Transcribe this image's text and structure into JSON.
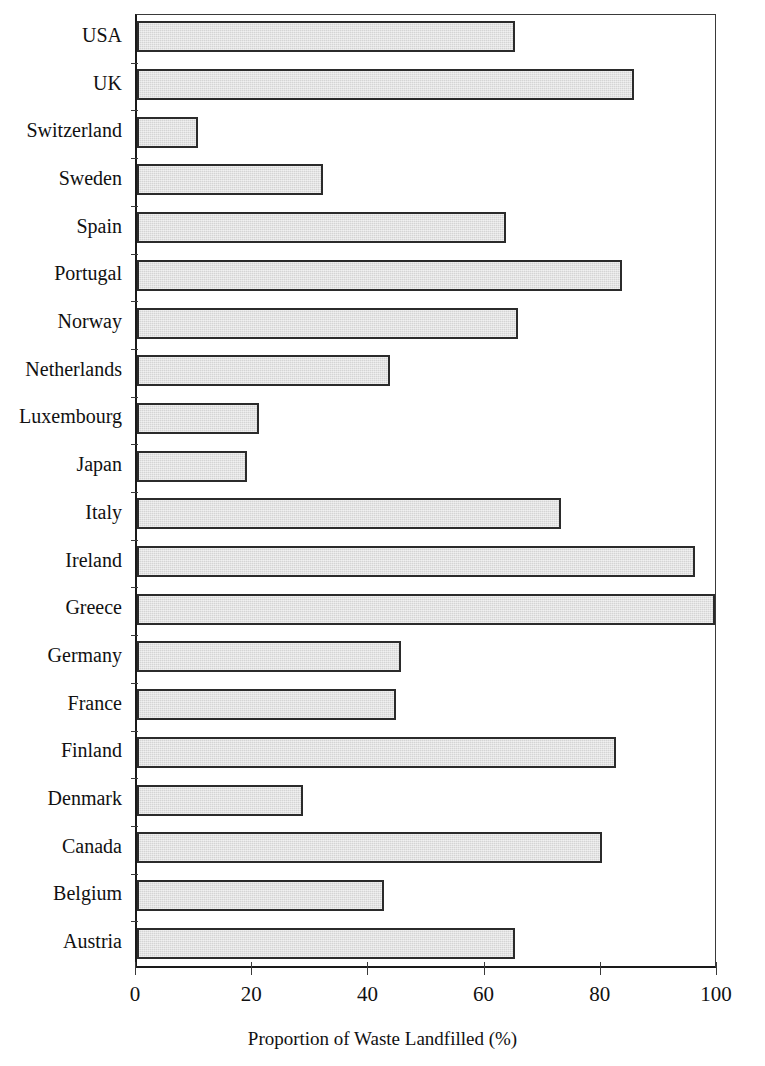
{
  "chart_data": {
    "type": "bar",
    "orientation": "horizontal",
    "title": "",
    "xlabel": "Proportion of Waste Landfilled (%)",
    "ylabel": "",
    "xlim": [
      0,
      100
    ],
    "xticks": [
      0,
      20,
      40,
      60,
      80,
      100
    ],
    "xtick_labels": [
      "0",
      "20",
      "40",
      "60",
      "80",
      "100"
    ],
    "grid": false,
    "legend": false,
    "categories": [
      "USA",
      "UK",
      "Switzerland",
      "Sweden",
      "Spain",
      "Portugal",
      "Norway",
      "Netherlands",
      "Luxembourg",
      "Japan",
      "Italy",
      "Ireland",
      "Greece",
      "Germany",
      "France",
      "Finland",
      "Denmark",
      "Canada",
      "Belgium",
      "Austria"
    ],
    "values": [
      65,
      85.5,
      10.5,
      32,
      63.5,
      83.5,
      65.5,
      43.5,
      21,
      19,
      73,
      96,
      99.5,
      45.5,
      44.5,
      82.5,
      28.5,
      80,
      42.5,
      65
    ],
    "bar_style": {
      "fill": "#d4d4d4",
      "edge": "#2b2b2b",
      "pattern": "fine-dotted-gray"
    },
    "axis_color": "#1a1a1a"
  }
}
